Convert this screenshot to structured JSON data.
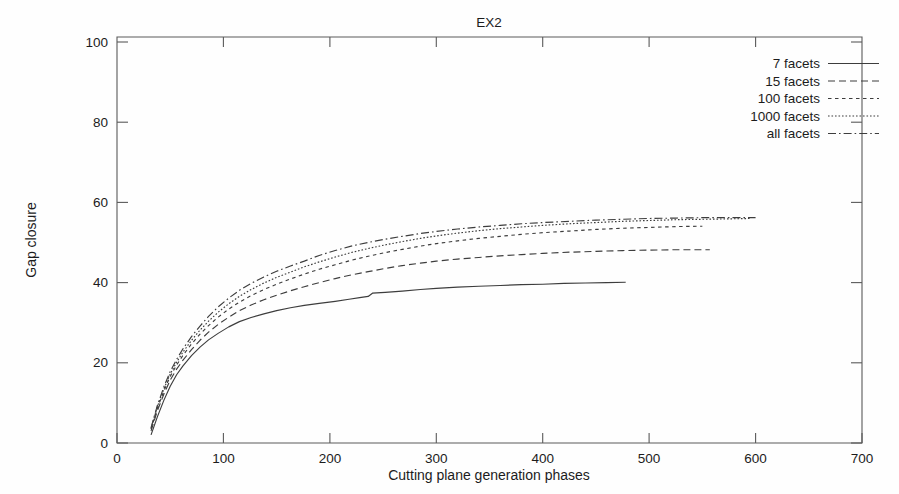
{
  "chart_data": {
    "type": "line",
    "title": "EX2",
    "xlabel": "Cutting plane generation phases",
    "ylabel": "Gap closure",
    "xlim": [
      0,
      700
    ],
    "ylim": [
      0,
      100
    ],
    "xticks": [
      0,
      100,
      200,
      300,
      400,
      500,
      600,
      700
    ],
    "yticks": [
      0,
      20,
      40,
      60,
      80,
      100
    ],
    "grid": false,
    "legend_position": "top-right",
    "series": [
      {
        "name": "7 facets",
        "dash": "solid",
        "points": [
          [
            32,
            2.0
          ],
          [
            38,
            6.5
          ],
          [
            44,
            10.5
          ],
          [
            50,
            14.0
          ],
          [
            56,
            16.8
          ],
          [
            62,
            19.0
          ],
          [
            70,
            21.5
          ],
          [
            78,
            23.6
          ],
          [
            86,
            25.4
          ],
          [
            95,
            27.0
          ],
          [
            105,
            28.6
          ],
          [
            115,
            29.9
          ],
          [
            126,
            30.9
          ],
          [
            138,
            31.8
          ],
          [
            150,
            32.6
          ],
          [
            163,
            33.3
          ],
          [
            176,
            33.9
          ],
          [
            190,
            34.4
          ],
          [
            205,
            34.9
          ],
          [
            218,
            35.4
          ],
          [
            228,
            35.8
          ],
          [
            236,
            36.1
          ],
          [
            240,
            36.9
          ],
          [
            252,
            37.1
          ],
          [
            268,
            37.4
          ],
          [
            285,
            37.8
          ],
          [
            300,
            38.1
          ],
          [
            320,
            38.4
          ],
          [
            340,
            38.6
          ],
          [
            360,
            38.8
          ],
          [
            380,
            39.0
          ],
          [
            400,
            39.1
          ],
          [
            420,
            39.3
          ],
          [
            440,
            39.4
          ],
          [
            460,
            39.5
          ],
          [
            478,
            39.6
          ]
        ]
      },
      {
        "name": "15 facets",
        "dash": "dashed",
        "points": [
          [
            32,
            3.0
          ],
          [
            38,
            8.0
          ],
          [
            44,
            12.0
          ],
          [
            50,
            15.5
          ],
          [
            56,
            18.2
          ],
          [
            62,
            20.4
          ],
          [
            70,
            23.0
          ],
          [
            78,
            25.3
          ],
          [
            86,
            27.3
          ],
          [
            95,
            29.2
          ],
          [
            105,
            31.0
          ],
          [
            115,
            32.6
          ],
          [
            126,
            34.0
          ],
          [
            138,
            35.3
          ],
          [
            150,
            36.4
          ],
          [
            163,
            37.5
          ],
          [
            176,
            38.5
          ],
          [
            190,
            39.5
          ],
          [
            205,
            40.5
          ],
          [
            220,
            41.4
          ],
          [
            236,
            42.2
          ],
          [
            252,
            43.0
          ],
          [
            268,
            43.7
          ],
          [
            285,
            44.3
          ],
          [
            300,
            44.8
          ],
          [
            320,
            45.3
          ],
          [
            340,
            45.7
          ],
          [
            360,
            46.1
          ],
          [
            380,
            46.4
          ],
          [
            400,
            46.7
          ],
          [
            425,
            47.0
          ],
          [
            450,
            47.2
          ],
          [
            475,
            47.4
          ],
          [
            500,
            47.5
          ],
          [
            525,
            47.6
          ],
          [
            557,
            47.6
          ]
        ]
      },
      {
        "name": "100 facets",
        "dash": "dotted",
        "points": [
          [
            32,
            3.4
          ],
          [
            38,
            8.6
          ],
          [
            44,
            12.8
          ],
          [
            50,
            16.4
          ],
          [
            56,
            19.2
          ],
          [
            62,
            21.6
          ],
          [
            70,
            24.4
          ],
          [
            78,
            26.8
          ],
          [
            86,
            28.9
          ],
          [
            95,
            31.0
          ],
          [
            105,
            33.0
          ],
          [
            115,
            34.7
          ],
          [
            126,
            36.3
          ],
          [
            138,
            37.8
          ],
          [
            150,
            39.1
          ],
          [
            163,
            40.4
          ],
          [
            176,
            41.6
          ],
          [
            190,
            42.8
          ],
          [
            205,
            43.9
          ],
          [
            220,
            45.0
          ],
          [
            236,
            46.0
          ],
          [
            252,
            46.9
          ],
          [
            268,
            47.7
          ],
          [
            285,
            48.5
          ],
          [
            300,
            49.1
          ],
          [
            320,
            49.8
          ],
          [
            340,
            50.4
          ],
          [
            360,
            50.9
          ],
          [
            380,
            51.4
          ],
          [
            400,
            51.8
          ],
          [
            425,
            52.2
          ],
          [
            450,
            52.6
          ],
          [
            475,
            52.9
          ],
          [
            500,
            53.1
          ],
          [
            525,
            53.3
          ],
          [
            550,
            53.4
          ]
        ]
      },
      {
        "name": "1000 facets",
        "dash": "fine-dotted",
        "points": [
          [
            32,
            3.6
          ],
          [
            38,
            9.0
          ],
          [
            44,
            13.3
          ],
          [
            50,
            17.0
          ],
          [
            56,
            19.9
          ],
          [
            62,
            22.4
          ],
          [
            70,
            25.3
          ],
          [
            78,
            27.8
          ],
          [
            86,
            30.0
          ],
          [
            95,
            32.2
          ],
          [
            105,
            34.3
          ],
          [
            115,
            36.1
          ],
          [
            126,
            37.8
          ],
          [
            138,
            39.4
          ],
          [
            150,
            40.8
          ],
          [
            163,
            42.1
          ],
          [
            176,
            43.4
          ],
          [
            190,
            44.6
          ],
          [
            205,
            45.8
          ],
          [
            220,
            46.9
          ],
          [
            236,
            47.9
          ],
          [
            252,
            48.8
          ],
          [
            268,
            49.6
          ],
          [
            285,
            50.4
          ],
          [
            300,
            51.0
          ],
          [
            320,
            51.7
          ],
          [
            340,
            52.3
          ],
          [
            360,
            52.8
          ],
          [
            380,
            53.2
          ],
          [
            400,
            53.6
          ],
          [
            425,
            54.0
          ],
          [
            450,
            54.3
          ],
          [
            475,
            54.6
          ],
          [
            500,
            54.8
          ],
          [
            525,
            55.0
          ],
          [
            550,
            55.1
          ],
          [
            575,
            55.2
          ],
          [
            596,
            55.3
          ]
        ]
      },
      {
        "name": "all facets",
        "dash": "dash-dot",
        "points": [
          [
            32,
            3.8
          ],
          [
            38,
            9.3
          ],
          [
            44,
            13.8
          ],
          [
            50,
            17.6
          ],
          [
            56,
            20.6
          ],
          [
            62,
            23.2
          ],
          [
            70,
            26.2
          ],
          [
            78,
            28.8
          ],
          [
            86,
            31.2
          ],
          [
            95,
            33.5
          ],
          [
            105,
            35.7
          ],
          [
            115,
            37.6
          ],
          [
            126,
            39.3
          ],
          [
            138,
            40.9
          ],
          [
            150,
            42.3
          ],
          [
            163,
            43.6
          ],
          [
            176,
            44.8
          ],
          [
            190,
            46.2
          ],
          [
            205,
            47.4
          ],
          [
            220,
            48.5
          ],
          [
            236,
            49.4
          ],
          [
            252,
            50.2
          ],
          [
            268,
            50.9
          ],
          [
            285,
            51.6
          ],
          [
            300,
            52.1
          ],
          [
            320,
            52.7
          ],
          [
            340,
            53.2
          ],
          [
            360,
            53.6
          ],
          [
            380,
            54.0
          ],
          [
            400,
            54.3
          ],
          [
            425,
            54.6
          ],
          [
            450,
            54.9
          ],
          [
            475,
            55.1
          ],
          [
            500,
            55.3
          ],
          [
            525,
            55.4
          ],
          [
            550,
            55.5
          ],
          [
            575,
            55.5
          ],
          [
            600,
            55.5
          ]
        ]
      }
    ]
  },
  "legend": {
    "items": [
      {
        "label": "7 facets"
      },
      {
        "label": "15 facets"
      },
      {
        "label": "100 facets"
      },
      {
        "label": "1000 facets"
      },
      {
        "label": "all facets"
      }
    ]
  }
}
